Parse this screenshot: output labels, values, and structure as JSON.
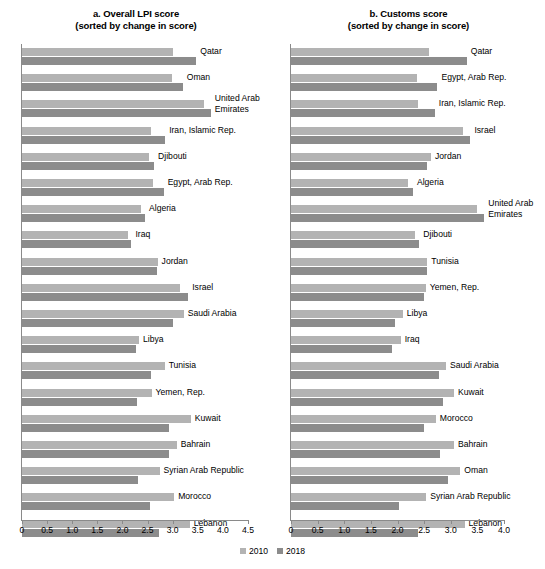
{
  "legend": {
    "entries": [
      {
        "label": "2010",
        "color": "#b3b3b3"
      },
      {
        "label": "2018",
        "color": "#8c8c8c"
      }
    ]
  },
  "chart_data": [
    {
      "type": "bar",
      "orientation": "horizontal",
      "panel": "a",
      "title": "a. Overall LPI score",
      "subtitle": "(sorted by change in score)",
      "xlabel": "",
      "ylabel": "",
      "xlim": [
        0,
        4.5
      ],
      "xticks": [
        "0",
        "0.5",
        "1.0",
        "1.5",
        "2.0",
        "2.5",
        "3.0",
        "3.5",
        "4.0",
        "4.5"
      ],
      "grid": false,
      "legend_position": "bottom-center",
      "categories": [
        "Qatar",
        "Oman",
        "United Arab Emirates",
        "Iran, Islamic Rep.",
        "Djibouti",
        "Egypt, Arab Rep.",
        "Algeria",
        "Iraq",
        "Jordan",
        "Israel",
        "Saudi Arabia",
        "Libya",
        "Tunisia",
        "Yemen, Rep.",
        "Kuwait",
        "Bahrain",
        "Syrian Arab Republic",
        "Morocco",
        "Lebanon"
      ],
      "series": [
        {
          "name": "2010",
          "color": "#b3b3b3",
          "values": [
            3.0,
            2.98,
            3.63,
            2.57,
            2.53,
            2.61,
            2.36,
            2.11,
            2.7,
            3.14,
            3.22,
            2.33,
            2.84,
            2.58,
            3.36,
            3.08,
            2.74,
            3.03,
            3.34
          ]
        },
        {
          "name": "2018",
          "color": "#8c8c8c",
          "values": [
            3.47,
            3.2,
            3.76,
            2.85,
            2.63,
            2.82,
            2.45,
            2.18,
            2.69,
            3.31,
            3.01,
            2.26,
            2.57,
            2.29,
            2.93,
            2.93,
            2.3,
            2.54,
            2.72
          ]
        }
      ]
    },
    {
      "type": "bar",
      "orientation": "horizontal",
      "panel": "b",
      "title": "b. Customs score",
      "subtitle": "(sorted by change in score)",
      "xlabel": "",
      "ylabel": "",
      "xlim": [
        0,
        4.0
      ],
      "xticks": [
        "0",
        "0.5",
        "1.0",
        "1.5",
        "2.0",
        "2.5",
        "3.0",
        "3.5",
        "4.0"
      ],
      "grid": false,
      "legend_position": "bottom-center",
      "categories": [
        "Qatar",
        "Egypt, Arab Rep.",
        "Iran, Islamic Rep.",
        "Israel",
        "Jordan",
        "Algeria",
        "United Arab Emirates",
        "Djibouti",
        "Tunisia",
        "Yemen, Rep.",
        "Libya",
        "Iraq",
        "Saudi Arabia",
        "Kuwait",
        "Morocco",
        "Bahrain",
        "Oman",
        "Syrian Arab Republic",
        "Lebanon"
      ],
      "series": [
        {
          "name": "2010",
          "color": "#b3b3b3",
          "values": [
            2.6,
            2.37,
            2.38,
            3.23,
            2.63,
            2.2,
            3.49,
            2.33,
            2.55,
            2.53,
            2.1,
            2.06,
            2.91,
            3.06,
            2.72,
            3.06,
            3.18,
            2.54,
            3.26
          ]
        },
        {
          "name": "2018",
          "color": "#8c8c8c",
          "values": [
            3.3,
            2.75,
            2.7,
            3.37,
            2.55,
            2.29,
            3.63,
            2.41,
            2.56,
            2.49,
            1.96,
            1.89,
            2.78,
            2.86,
            2.49,
            2.8,
            2.94,
            2.02,
            2.39
          ]
        }
      ]
    }
  ]
}
